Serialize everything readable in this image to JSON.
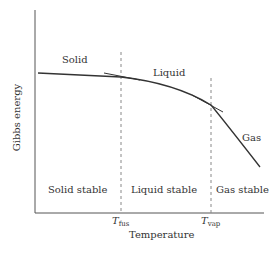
{
  "diagram": {
    "type": "gibbs-energy-vs-temperature",
    "y_axis_label": "Gibbs energy",
    "x_axis_label": "Temperature",
    "ticks": [
      {
        "symbol": "T",
        "subscript": "fus"
      },
      {
        "symbol": "T",
        "subscript": "vap"
      }
    ],
    "curve_labels": {
      "solid": "Solid",
      "liquid": "Liquid",
      "gas": "Gas"
    },
    "region_labels": {
      "solid_stable": "Solid stable",
      "liquid_stable": "Liquid stable",
      "gas_stable": "Gas stable"
    },
    "colors": {
      "line": "#333333",
      "dashed": "#888888",
      "text": "#333333"
    }
  }
}
